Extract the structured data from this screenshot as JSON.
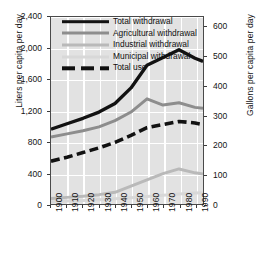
{
  "chart_data": {
    "type": "line",
    "title": "",
    "xlabel": "",
    "ylabel": "Liters per capita per day",
    "ylabel_right": "Gallons per capita per day",
    "x": [
      1900,
      1910,
      1920,
      1930,
      1940,
      1950,
      1960,
      1970,
      1980,
      1990,
      1995
    ],
    "xticklabels": [
      "1900",
      "1910",
      "1920",
      "1930",
      "1940",
      "1950",
      "1960",
      "1970",
      "1980",
      "1990"
    ],
    "xtickvalues": [
      1900,
      1910,
      1920,
      1930,
      1940,
      1950,
      1960,
      1970,
      1980,
      1990
    ],
    "xlim": [
      1900,
      1995
    ],
    "ylim": [
      0,
      2400
    ],
    "yticklabels": [
      "0",
      "400",
      "800",
      "1,200",
      "1,600",
      "2,000",
      "2,400"
    ],
    "ytickvalues": [
      0,
      400,
      800,
      1200,
      1600,
      2000,
      2400
    ],
    "ylim_right": [
      0,
      634
    ],
    "yticklabels_right": [
      "0",
      "100",
      "200",
      "300",
      "400",
      "500",
      "600"
    ],
    "ytickvalues_right": [
      0,
      100,
      200,
      300,
      400,
      500,
      600
    ],
    "grid": true,
    "legend_position": "top-center",
    "series": [
      {
        "name": "Total withdrawal",
        "color": "#121212",
        "style": "solid",
        "width": 3.4,
        "values": [
          960,
          1030,
          1100,
          1180,
          1290,
          1490,
          1780,
          1880,
          1980,
          1870,
          1830
        ]
      },
      {
        "name": "Agricultural withdrawal",
        "color": "#8d8d8d",
        "style": "solid",
        "width": 3.0,
        "values": [
          860,
          900,
          940,
          990,
          1070,
          1180,
          1350,
          1270,
          1300,
          1240,
          1230
        ]
      },
      {
        "name": "Industrial withdrawal",
        "color": "#b9b9b9",
        "style": "solid",
        "width": 3.0,
        "values": [
          70,
          85,
          100,
          120,
          150,
          230,
          310,
          390,
          450,
          400,
          385
        ]
      },
      {
        "name": "Municipal withdrawal",
        "color": "#d8d8d8",
        "style": "solid",
        "width": 3.0,
        "values": [
          30,
          38,
          46,
          55,
          66,
          80,
          96,
          112,
          128,
          140,
          145
        ]
      },
      {
        "name": "Total use",
        "color": "#121212",
        "style": "dashed",
        "width": 3.6,
        "values": [
          550,
          600,
          660,
          720,
          790,
          880,
          980,
          1020,
          1060,
          1040,
          1020
        ]
      }
    ]
  },
  "legend": {
    "items": [
      {
        "label": "Total withdrawal",
        "style": "solid",
        "color": "#121212",
        "thick": true
      },
      {
        "label": "Agricultural withdrawal",
        "style": "solid",
        "color": "#8d8d8d",
        "thick": false
      },
      {
        "label": "Industrial withdrawal",
        "style": "solid",
        "color": "#b9b9b9",
        "thick": false
      },
      {
        "label": "Municipal withdrawal",
        "style": "solid",
        "color": "#d8d8d8",
        "thick": false
      },
      {
        "label": "Total use",
        "style": "dashed",
        "color": "#121212",
        "thick": true
      }
    ]
  }
}
